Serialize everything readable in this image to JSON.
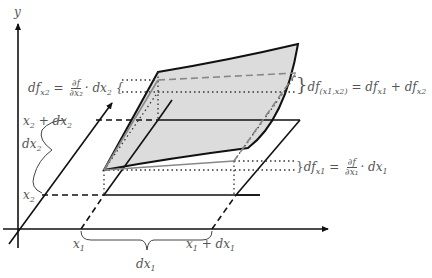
{
  "figure": {
    "colors": {
      "axis": "#111111",
      "surface_fill": "#dcdcdc",
      "guide_dashed": "#888888",
      "text": "#555555"
    }
  },
  "labels": {
    "y_axis": "y",
    "x1": "x",
    "x1_sub": "1",
    "x1_plus_dx1": "x",
    "x1_plus_dx1_sub": "1",
    "x1_plus_dx1_tail": " + dx",
    "x1_plus_dx1_tail_sub": "1",
    "dx1": "dx",
    "dx1_sub": "1",
    "x2": "x",
    "x2_sub": "2",
    "x2_plus_dx2": "x",
    "x2_plus_dx2_sub": "2",
    "x2_plus_dx2_tail": " + dx",
    "x2_plus_dx2_tail_sub": "2",
    "dx2": "dx",
    "dx2_sub": "2",
    "df_x2_lhs": "df",
    "df_x2_lhs_sub": "x2",
    "df_x2_eq": " = ",
    "df_x2_num": "∂f",
    "df_x2_den": "∂x₂",
    "df_x2_tail": "· dx",
    "df_x2_tail_sub": "2",
    "df_x2_brace": "{",
    "df_total_brace": "}",
    "df_total_lhs": "df",
    "df_total_lhs_sub": "(x1,x2)",
    "df_total_rhs": " = df",
    "df_total_rhs_sub1": "x1",
    "df_total_plus": " + df",
    "df_total_rhs_sub2": "x2",
    "df_x1_brace": "}",
    "df_x1_lhs": "df",
    "df_x1_lhs_sub": "x1",
    "df_x1_eq": " = ",
    "df_x1_num": "∂f",
    "df_x1_den": "∂x₁",
    "df_x1_tail": "· dx",
    "df_x1_tail_sub": "1"
  }
}
